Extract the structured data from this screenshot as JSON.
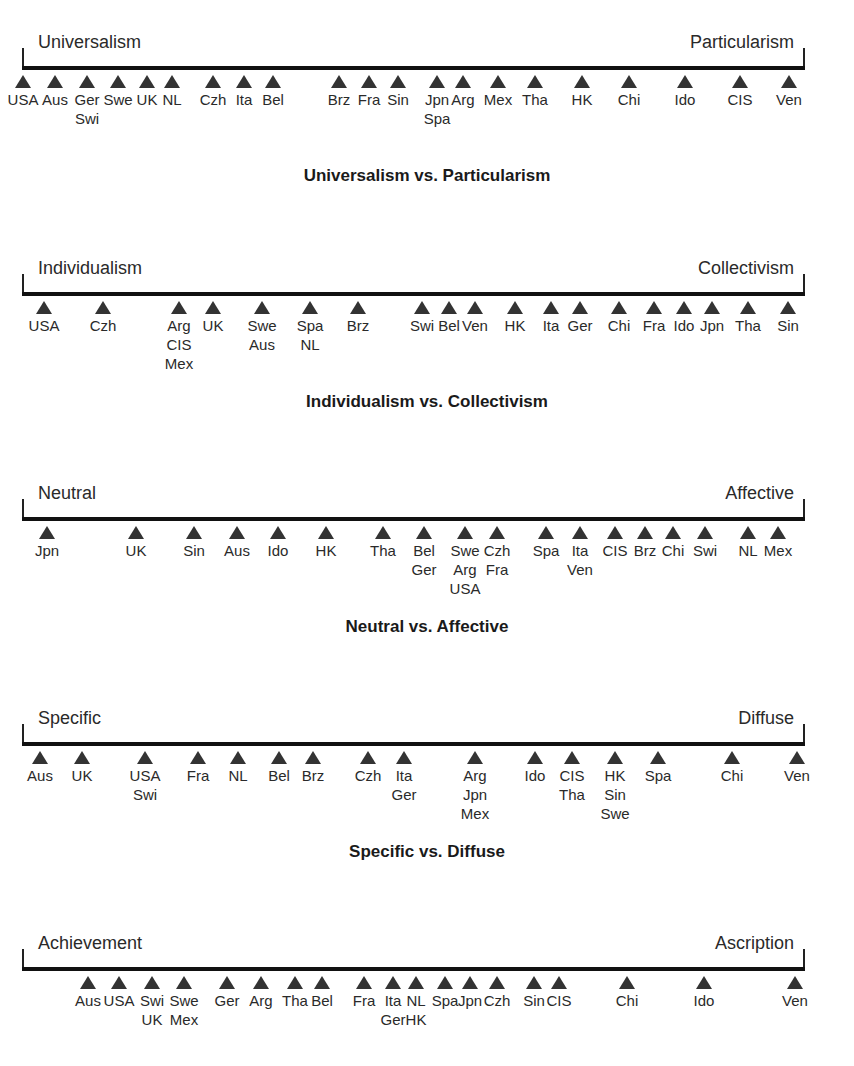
{
  "chart_data": {
    "type": "scatter",
    "axis_x_range": [
      0,
      100
    ],
    "dimensions": [
      {
        "title": "Universalism vs. Particularism",
        "left_pole": "Universalism",
        "right_pole": "Particularism",
        "markers": [
          {
            "labels": [
              "USA"
            ],
            "x": 23
          },
          {
            "labels": [
              "Aus"
            ],
            "x": 55
          },
          {
            "labels": [
              "Ger",
              "Swi"
            ],
            "x": 87
          },
          {
            "labels": [
              "Swe"
            ],
            "x": 118
          },
          {
            "labels": [
              "UK"
            ],
            "x": 147
          },
          {
            "labels": [
              "NL"
            ],
            "x": 172
          },
          {
            "labels": [
              "Czh"
            ],
            "x": 213
          },
          {
            "labels": [
              "Ita"
            ],
            "x": 244
          },
          {
            "labels": [
              "Bel"
            ],
            "x": 273
          },
          {
            "labels": [
              "Brz"
            ],
            "x": 339
          },
          {
            "labels": [
              "Fra"
            ],
            "x": 369
          },
          {
            "labels": [
              "Sin"
            ],
            "x": 398
          },
          {
            "labels": [
              "Jpn",
              "Spa"
            ],
            "x": 437
          },
          {
            "labels": [
              "Arg"
            ],
            "x": 463
          },
          {
            "labels": [
              "Mex"
            ],
            "x": 498
          },
          {
            "labels": [
              "Tha"
            ],
            "x": 535
          },
          {
            "labels": [
              "HK"
            ],
            "x": 582
          },
          {
            "labels": [
              "Chi"
            ],
            "x": 629
          },
          {
            "labels": [
              "Ido"
            ],
            "x": 685
          },
          {
            "labels": [
              "CIS"
            ],
            "x": 740
          },
          {
            "labels": [
              "Ven"
            ],
            "x": 789
          }
        ]
      },
      {
        "title": "Individualism vs. Collectivism",
        "left_pole": "Individualism",
        "right_pole": "Collectivism",
        "markers": [
          {
            "labels": [
              "USA"
            ],
            "x": 44
          },
          {
            "labels": [
              "Czh"
            ],
            "x": 103
          },
          {
            "labels": [
              "Arg",
              "CIS",
              "Mex"
            ],
            "x": 179
          },
          {
            "labels": [
              "UK"
            ],
            "x": 213
          },
          {
            "labels": [
              "Swe",
              "Aus"
            ],
            "x": 262
          },
          {
            "labels": [
              "Spa",
              "NL"
            ],
            "x": 310
          },
          {
            "labels": [
              "Brz"
            ],
            "x": 358
          },
          {
            "labels": [
              "Swi"
            ],
            "x": 422
          },
          {
            "labels": [
              "Bel"
            ],
            "x": 449
          },
          {
            "labels": [
              "Ven"
            ],
            "x": 475
          },
          {
            "labels": [
              "HK"
            ],
            "x": 515
          },
          {
            "labels": [
              "Ita"
            ],
            "x": 551
          },
          {
            "labels": [
              "Ger"
            ],
            "x": 580
          },
          {
            "labels": [
              "Chi"
            ],
            "x": 619
          },
          {
            "labels": [
              "Fra"
            ],
            "x": 654
          },
          {
            "labels": [
              "Ido"
            ],
            "x": 684
          },
          {
            "labels": [
              "Jpn"
            ],
            "x": 712
          },
          {
            "labels": [
              "Tha"
            ],
            "x": 748
          },
          {
            "labels": [
              "Sin"
            ],
            "x": 788
          }
        ]
      },
      {
        "title": "Neutral vs. Affective",
        "left_pole": "Neutral",
        "right_pole": "Affective",
        "markers": [
          {
            "labels": [
              "Jpn"
            ],
            "x": 47
          },
          {
            "labels": [
              "UK"
            ],
            "x": 136
          },
          {
            "labels": [
              "Sin"
            ],
            "x": 194
          },
          {
            "labels": [
              "Aus"
            ],
            "x": 237
          },
          {
            "labels": [
              "Ido"
            ],
            "x": 278
          },
          {
            "labels": [
              "HK"
            ],
            "x": 326
          },
          {
            "labels": [
              "Tha"
            ],
            "x": 383
          },
          {
            "labels": [
              "Bel",
              "Ger"
            ],
            "x": 424
          },
          {
            "labels": [
              "Swe",
              "Arg",
              "USA"
            ],
            "x": 465
          },
          {
            "labels": [
              "Czh",
              "Fra"
            ],
            "x": 497
          },
          {
            "labels": [
              "Spa"
            ],
            "x": 546
          },
          {
            "labels": [
              "Ita",
              "Ven"
            ],
            "x": 580
          },
          {
            "labels": [
              "CIS"
            ],
            "x": 615
          },
          {
            "labels": [
              "Brz"
            ],
            "x": 645
          },
          {
            "labels": [
              "Chi"
            ],
            "x": 673
          },
          {
            "labels": [
              "Swi"
            ],
            "x": 705
          },
          {
            "labels": [
              "NL"
            ],
            "x": 748
          },
          {
            "labels": [
              "Mex"
            ],
            "x": 778
          }
        ]
      },
      {
        "title": "Specific vs. Diffuse",
        "left_pole": "Specific",
        "right_pole": "Diffuse",
        "markers": [
          {
            "labels": [
              "Aus"
            ],
            "x": 40
          },
          {
            "labels": [
              "UK"
            ],
            "x": 82
          },
          {
            "labels": [
              "USA",
              "Swi"
            ],
            "x": 145
          },
          {
            "labels": [
              "Fra"
            ],
            "x": 198
          },
          {
            "labels": [
              "NL"
            ],
            "x": 238
          },
          {
            "labels": [
              "Bel"
            ],
            "x": 279
          },
          {
            "labels": [
              "Brz"
            ],
            "x": 313
          },
          {
            "labels": [
              "Czh"
            ],
            "x": 368
          },
          {
            "labels": [
              "Ita",
              "Ger"
            ],
            "x": 404
          },
          {
            "labels": [
              "Arg",
              "Jpn",
              "Mex"
            ],
            "x": 475
          },
          {
            "labels": [
              "Ido"
            ],
            "x": 535
          },
          {
            "labels": [
              "CIS",
              "Tha"
            ],
            "x": 572
          },
          {
            "labels": [
              "HK",
              "Sin",
              "Swe"
            ],
            "x": 615
          },
          {
            "labels": [
              "Spa"
            ],
            "x": 658
          },
          {
            "labels": [
              "Chi"
            ],
            "x": 732
          },
          {
            "labels": [
              "Ven"
            ],
            "x": 797
          }
        ]
      },
      {
        "title": "",
        "left_pole": "Achievement",
        "right_pole": "Ascription",
        "markers": [
          {
            "labels": [
              "Aus"
            ],
            "x": 88
          },
          {
            "labels": [
              "USA"
            ],
            "x": 119
          },
          {
            "labels": [
              "Swi",
              "UK"
            ],
            "x": 152
          },
          {
            "labels": [
              "Swe",
              "Mex"
            ],
            "x": 184
          },
          {
            "labels": [
              "Ger"
            ],
            "x": 227
          },
          {
            "labels": [
              "Arg"
            ],
            "x": 261
          },
          {
            "labels": [
              "Tha"
            ],
            "x": 295
          },
          {
            "labels": [
              "Bel"
            ],
            "x": 322
          },
          {
            "labels": [
              "Fra"
            ],
            "x": 364
          },
          {
            "labels": [
              "Ita",
              "Ger"
            ],
            "x": 393
          },
          {
            "labels": [
              "NL",
              "HK"
            ],
            "x": 416
          },
          {
            "labels": [
              "Spa"
            ],
            "x": 445
          },
          {
            "labels": [
              "Jpn"
            ],
            "x": 470
          },
          {
            "labels": [
              "Czh"
            ],
            "x": 497
          },
          {
            "labels": [
              "Sin"
            ],
            "x": 534
          },
          {
            "labels": [
              "CIS"
            ],
            "x": 559
          },
          {
            "labels": [
              "Chi"
            ],
            "x": 627
          },
          {
            "labels": [
              "Ido"
            ],
            "x": 704
          },
          {
            "labels": [
              "Ven"
            ],
            "x": 795
          }
        ]
      }
    ]
  },
  "rows": [
    {
      "left_pole": "Universalism",
      "right_pole": "Particularism",
      "caption": "Universalism vs. Particularism"
    },
    {
      "left_pole": "Individualism",
      "right_pole": "Collectivism",
      "caption": "Individualism vs. Collectivism"
    },
    {
      "left_pole": "Neutral",
      "right_pole": "Affective",
      "caption": "Neutral vs. Affective"
    },
    {
      "left_pole": "Specific",
      "right_pole": "Diffuse",
      "caption": "Specific vs. Diffuse"
    },
    {
      "left_pole": "Achievement",
      "right_pole": "Ascription",
      "caption": ""
    }
  ],
  "colors": {
    "axis": "#111111",
    "marker": "#333333",
    "text": "#2a2a2a"
  }
}
